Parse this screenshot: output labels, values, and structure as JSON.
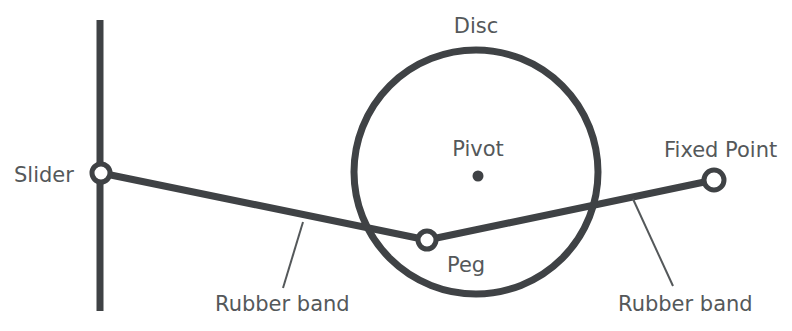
{
  "figure": {
    "kind": "mechanism-diagram",
    "title_text": "",
    "background_color": "#ffffff",
    "stroke_color": "#3f4245",
    "text_color": "#54585a",
    "width": 792,
    "height": 331
  },
  "labels": {
    "slider": "Slider",
    "disc": "Disc",
    "pivot": "Pivot",
    "peg": "Peg",
    "fixed_point": "Fixed Point",
    "rubber_band_left": "Rubber band",
    "rubber_band_right": "Rubber band"
  },
  "parts": {
    "slider_track": {
      "name": "vertical-slider-track",
      "x": 100,
      "y_top": 20,
      "y_bottom": 311,
      "thickness": 7
    },
    "slider_ring": {
      "name": "slider-ring",
      "cx": 101,
      "cy": 173,
      "r": 9,
      "stroke": 5,
      "fill": "#ffffff"
    },
    "disc": {
      "name": "disc-outline",
      "cx": 476,
      "cy": 172,
      "r": 122,
      "stroke": 7,
      "fill": "none"
    },
    "pivot_dot": {
      "name": "pivot-dot",
      "cx": 478,
      "cy": 176,
      "r": 5.5,
      "fill": "#3f4245"
    },
    "peg_ring": {
      "name": "peg-ring",
      "cx": 427,
      "cy": 240,
      "r": 9,
      "stroke": 5,
      "fill": "#ffffff"
    },
    "fixed_point_ring": {
      "name": "fixed-point-ring",
      "cx": 714,
      "cy": 180,
      "r": 10,
      "stroke": 5,
      "fill": "#ffffff"
    },
    "band_left_segment": {
      "name": "rubber-band-left-segment",
      "x1": 101,
      "y1": 173,
      "x2": 427,
      "y2": 240,
      "thickness": 7
    },
    "band_right_segment": {
      "name": "rubber-band-right-segment",
      "x1": 427,
      "y1": 240,
      "x2": 714,
      "y2": 180,
      "thickness": 7
    },
    "leader_left": {
      "name": "leader-line-left",
      "x1": 303,
      "y1": 222,
      "x2": 283,
      "y2": 288,
      "thickness": 2
    },
    "leader_right": {
      "name": "leader-line-right",
      "x1": 633,
      "y1": 199,
      "x2": 673,
      "y2": 286,
      "thickness": 2
    }
  },
  "label_positions": {
    "slider": {
      "x": 14,
      "y": 182,
      "anchor": "start"
    },
    "disc": {
      "x": 476,
      "y": 33,
      "anchor": "middle"
    },
    "pivot": {
      "x": 478,
      "y": 156,
      "anchor": "middle"
    },
    "peg": {
      "x": 447,
      "y": 272,
      "anchor": "start"
    },
    "fixed_point": {
      "x": 664,
      "y": 157,
      "anchor": "start"
    },
    "rubber_band_left": {
      "x": 215,
      "y": 311,
      "anchor": "start"
    },
    "rubber_band_right": {
      "x": 618,
      "y": 311,
      "anchor": "start"
    }
  }
}
